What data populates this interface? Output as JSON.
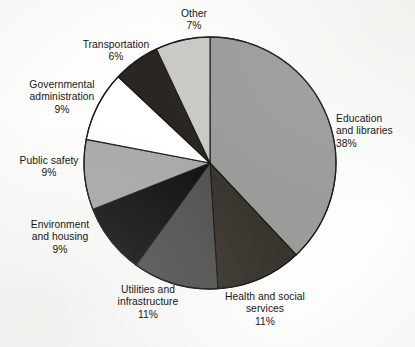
{
  "chart_data": {
    "type": "pie",
    "title": "",
    "subtitle": "",
    "xlabel": "",
    "ylabel": "",
    "legend_position": "none",
    "grid": false,
    "start_angle_deg": 0,
    "direction": "clockwise",
    "units": "percent",
    "categories": [
      "Education and libraries",
      "Health and social services",
      "Utilities and infrastructure",
      "Environment and housing",
      "Public safety",
      "Governmental administration",
      "Transportation",
      "Other"
    ],
    "values": [
      38,
      11,
      11,
      9,
      9,
      9,
      6,
      7
    ],
    "slices": [
      {
        "name": "Education and libraries",
        "value": 38,
        "value_label": "38%",
        "label_lines": [
          "Education",
          "and libraries"
        ],
        "color": "#9b9b99",
        "start_deg": 0,
        "end_deg": 136.8
      },
      {
        "name": "Health and social services",
        "value": 11,
        "value_label": "11%",
        "label_lines": [
          "Health and social",
          "services"
        ],
        "color": "#3a342e",
        "start_deg": 136.8,
        "end_deg": 176.4
      },
      {
        "name": "Utilities and infrastructure",
        "value": 11,
        "value_label": "11%",
        "label_lines": [
          "Utilities and",
          "infrastructure"
        ],
        "color": "#525250",
        "start_deg": 176.4,
        "end_deg": 216.0
      },
      {
        "name": "Environment and housing",
        "value": 9,
        "value_label": "9%",
        "label_lines": [
          "Environment",
          "and housing"
        ],
        "color": "#141210",
        "start_deg": 216.0,
        "end_deg": 248.4
      },
      {
        "name": "Public safety",
        "value": 9,
        "value_label": "9%",
        "label_lines": [
          "Public safety"
        ],
        "color": "#a9a9a7",
        "start_deg": 248.4,
        "end_deg": 280.8
      },
      {
        "name": "Governmental administration",
        "value": 9,
        "value_label": "9%",
        "label_lines": [
          "Governmental",
          "administration"
        ],
        "color": "#ffffff",
        "start_deg": 280.8,
        "end_deg": 313.2
      },
      {
        "name": "Transportation",
        "value": 6,
        "value_label": "6%",
        "label_lines": [
          "Transportation"
        ],
        "color": "#2b2622",
        "start_deg": 313.2,
        "end_deg": 334.8
      },
      {
        "name": "Other",
        "value": 7,
        "value_label": "7%",
        "label_lines": [
          "Other"
        ],
        "color": "#c9c9c6",
        "start_deg": 334.8,
        "end_deg": 360.0
      }
    ],
    "geometry": {
      "center_x": 210,
      "center_y": 163,
      "radius": 126
    },
    "colors": {
      "outline": "#1a1a1a",
      "text": "#17171a",
      "background": "#fdfdfb"
    }
  },
  "labels": {
    "education": {
      "line1": "Education",
      "line2": "and libraries",
      "pct": "38%"
    },
    "health": {
      "line1": "Health and social",
      "line2": "services",
      "pct": "11%"
    },
    "utilities": {
      "line1": "Utilities and",
      "line2": "infrastructure",
      "pct": "11%"
    },
    "environment": {
      "line1": "Environment",
      "line2": "and housing",
      "pct": "9%"
    },
    "publicsafety": {
      "line1": "Public safety",
      "line2": "",
      "pct": "9%"
    },
    "governmental": {
      "line1": "Governmental",
      "line2": "administration",
      "pct": "9%"
    },
    "transportation": {
      "line1": "Transportation",
      "line2": "",
      "pct": "6%"
    },
    "other": {
      "line1": "Other",
      "line2": "",
      "pct": "7%"
    }
  }
}
